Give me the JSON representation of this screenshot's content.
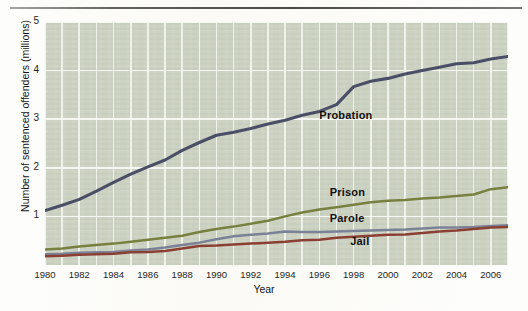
{
  "chart_data": {
    "type": "line",
    "title": "",
    "xlabel": "Year",
    "ylabel": "Number of sentenced offenders (millions)",
    "xlim": [
      1980,
      2007
    ],
    "ylim": [
      0,
      5
    ],
    "yticks": [
      1,
      2,
      3,
      4,
      5
    ],
    "xticks": [
      1980,
      1982,
      1984,
      1986,
      1988,
      1990,
      1992,
      1994,
      1996,
      1998,
      2000,
      2002,
      2004,
      2006
    ],
    "grid": true,
    "legend_position": "inline-annotations",
    "x": [
      1980,
      1981,
      1982,
      1983,
      1984,
      1985,
      1986,
      1987,
      1988,
      1989,
      1990,
      1991,
      1992,
      1993,
      1994,
      1995,
      1996,
      1997,
      1998,
      1999,
      2000,
      2001,
      2002,
      2003,
      2004,
      2005,
      2006,
      2007
    ],
    "series": [
      {
        "name": "Probation",
        "color": "#4a4e66",
        "values": [
          1.12,
          1.23,
          1.35,
          1.52,
          1.7,
          1.87,
          2.02,
          2.16,
          2.36,
          2.52,
          2.67,
          2.73,
          2.81,
          2.9,
          2.98,
          3.08,
          3.16,
          3.3,
          3.67,
          3.78,
          3.84,
          3.93,
          4.0,
          4.07,
          4.14,
          4.16,
          4.24,
          4.29
        ]
      },
      {
        "name": "Prison",
        "color": "#76803f",
        "values": [
          0.32,
          0.34,
          0.38,
          0.41,
          0.44,
          0.48,
          0.52,
          0.56,
          0.6,
          0.68,
          0.74,
          0.79,
          0.85,
          0.91,
          1.0,
          1.08,
          1.14,
          1.19,
          1.24,
          1.29,
          1.32,
          1.34,
          1.37,
          1.39,
          1.42,
          1.45,
          1.56,
          1.6
        ]
      },
      {
        "name": "Parole",
        "color": "#7b8196",
        "values": [
          0.22,
          0.23,
          0.25,
          0.26,
          0.27,
          0.3,
          0.32,
          0.36,
          0.41,
          0.46,
          0.53,
          0.59,
          0.62,
          0.65,
          0.69,
          0.68,
          0.68,
          0.69,
          0.7,
          0.71,
          0.72,
          0.73,
          0.75,
          0.77,
          0.77,
          0.78,
          0.8,
          0.82
        ]
      },
      {
        "name": "Jail",
        "color": "#8b3f32",
        "values": [
          0.18,
          0.19,
          0.21,
          0.22,
          0.23,
          0.26,
          0.27,
          0.29,
          0.34,
          0.39,
          0.4,
          0.42,
          0.44,
          0.46,
          0.48,
          0.51,
          0.52,
          0.56,
          0.58,
          0.6,
          0.62,
          0.63,
          0.66,
          0.69,
          0.71,
          0.74,
          0.77,
          0.78
        ]
      }
    ],
    "annotations": [
      {
        "label": "Probation",
        "x": 1996.0,
        "y": 3.06
      },
      {
        "label": "Prison",
        "x": 1996.6,
        "y": 1.49
      },
      {
        "label": "Parole",
        "x": 1996.6,
        "y": 0.94
      },
      {
        "label": "Jail",
        "x": 1997.8,
        "y": 0.47
      }
    ]
  },
  "axis": {
    "y_title": "Number of sentenced offenders (millions)",
    "x_title": "Year",
    "yticks": [
      "1",
      "2",
      "3",
      "4",
      "5"
    ],
    "xticks": [
      "1980",
      "1982",
      "1984",
      "1986",
      "1988",
      "1990",
      "1992",
      "1994",
      "1996",
      "1998",
      "2000",
      "2002",
      "2004",
      "2006"
    ]
  },
  "colors": {
    "plot_background": "#ccd2c2",
    "page_background": "#fdfdfb",
    "grid": "#f4f6f0",
    "probation": "#4a4e66",
    "prison": "#76803f",
    "parole": "#7b8196",
    "jail": "#8b3f32"
  }
}
